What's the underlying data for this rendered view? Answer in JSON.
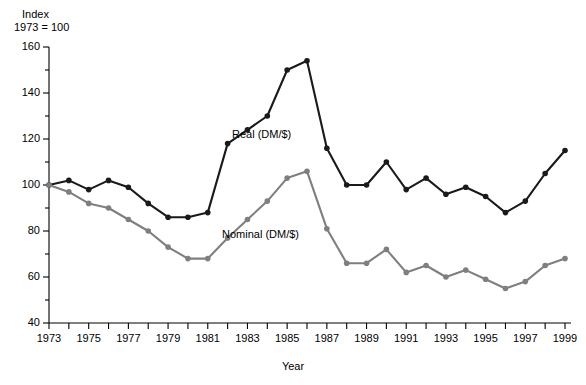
{
  "chart_data": {
    "type": "line",
    "title": "",
    "ylabel_line1": "Index",
    "ylabel_line2": "1973 = 100",
    "xlabel": "Year",
    "xlim": [
      1973,
      1999
    ],
    "ylim": [
      40,
      160
    ],
    "ytick_major_step": 20,
    "ytick_minor_step": 10,
    "grid": false,
    "legend_position": "inline-annotation",
    "ytick_labels": [
      "160",
      "140",
      "120",
      "100",
      "80",
      "60",
      "40"
    ],
    "ytick_values": [
      160,
      140,
      120,
      100,
      80,
      60,
      40
    ],
    "xtick_labels": [
      "1973",
      "1975",
      "1977",
      "1979",
      "1981",
      "1983",
      "1985",
      "1987",
      "1989",
      "1991",
      "1993",
      "1995",
      "1997",
      "1999"
    ],
    "xtick_values": [
      1973,
      1975,
      1977,
      1979,
      1981,
      1983,
      1985,
      1987,
      1989,
      1991,
      1993,
      1995,
      1997,
      1999
    ],
    "x": [
      1973,
      1974,
      1975,
      1976,
      1977,
      1978,
      1979,
      1980,
      1981,
      1982,
      1983,
      1984,
      1985,
      1986,
      1987,
      1988,
      1989,
      1990,
      1991,
      1992,
      1993,
      1994,
      1995,
      1996,
      1997,
      1998,
      1999
    ],
    "series": [
      {
        "name": "Real (DM/$)",
        "color": "#1a1a1a",
        "marker": "circle",
        "values": [
          100,
          102,
          98,
          102,
          99,
          92,
          86,
          86,
          88,
          118,
          124,
          130,
          150,
          154,
          116,
          100,
          100,
          110,
          98,
          103,
          96,
          99,
          95,
          88,
          93,
          105,
          115
        ]
      },
      {
        "name": "Nominal (DM/$)",
        "color": "#7f7f7f",
        "marker": "circle",
        "values": [
          100,
          97,
          92,
          90,
          85,
          80,
          73,
          68,
          68,
          77,
          85,
          93,
          103,
          106,
          81,
          66,
          66,
          72,
          62,
          65,
          60,
          63,
          59,
          55,
          58,
          65,
          68
        ]
      }
    ],
    "annotations": [
      {
        "text": "Real (DM/$)",
        "x_px": 232,
        "y_px": 128
      },
      {
        "text": "Nominal (DM/$)",
        "x_px": 222,
        "y_px": 228
      }
    ]
  }
}
